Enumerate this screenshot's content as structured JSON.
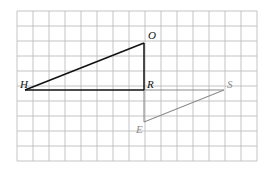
{
  "diagram": {
    "type": "grid-triangles",
    "grid": {
      "columns": 15,
      "rows": 10,
      "line_color": "#b8b8b8"
    },
    "triangles": [
      {
        "name": "HOR",
        "color": "#1a1a1a",
        "vertices": [
          "H",
          "O",
          "R"
        ]
      },
      {
        "name": "SER",
        "color": "#8a8a8a",
        "vertices": [
          "S",
          "E",
          "R"
        ]
      }
    ],
    "labels": {
      "O": "O",
      "H": "H",
      "R": "R",
      "S": "S",
      "E": "E"
    }
  }
}
